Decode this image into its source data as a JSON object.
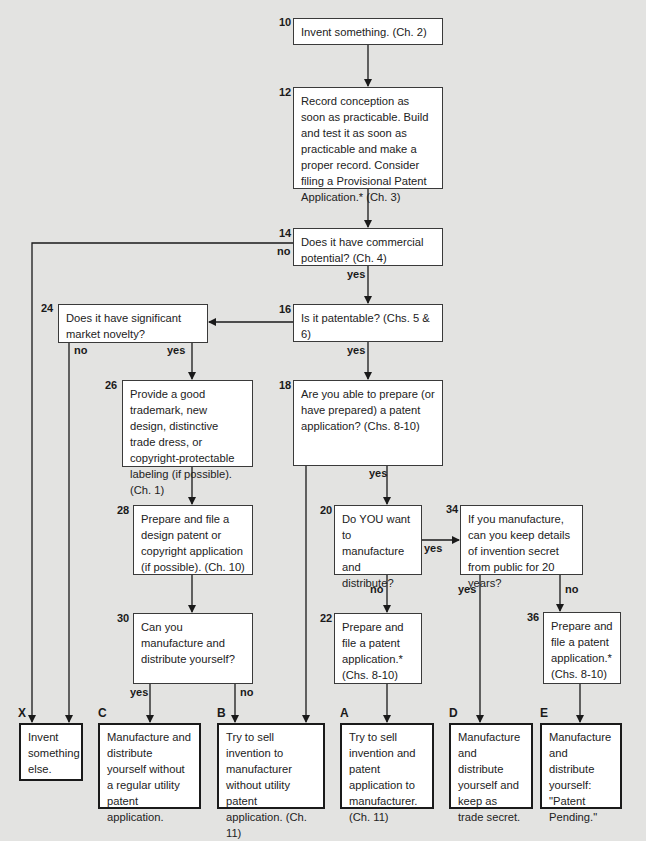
{
  "diagram": {
    "type": "flowchart",
    "nodes": [
      {
        "id": "10",
        "number": "10",
        "text": "Invent something. (Ch. 2)"
      },
      {
        "id": "12",
        "number": "12",
        "text": "Record conception as soon as practicable. Build and test it as soon as practicable and make a proper record. Consider filing a Provisional Patent Application.* (Ch. 3)"
      },
      {
        "id": "14",
        "number": "14",
        "text": "Does it have commercial potential? (Ch. 4)"
      },
      {
        "id": "16",
        "number": "16",
        "text": "Is it patentable? (Chs. 5 & 6)"
      },
      {
        "id": "18",
        "number": "18",
        "text": "Are you able to prepare (or have prepared) a patent application? (Chs. 8-10)"
      },
      {
        "id": "20",
        "number": "20",
        "text": "Do YOU want to manufacture and distribute?"
      },
      {
        "id": "22",
        "number": "22",
        "text": "Prepare and file a patent application.* (Chs. 8-10)"
      },
      {
        "id": "24",
        "number": "24",
        "text": "Does it have significant market novelty?"
      },
      {
        "id": "26",
        "number": "26",
        "text": "Provide a good trademark, new design, distinctive trade dress, or copyright-protectable labeling (if possible). (Ch. 1)"
      },
      {
        "id": "28",
        "number": "28",
        "text": "Prepare and file a design patent or copyright application (if possible). (Ch. 10)"
      },
      {
        "id": "30",
        "number": "30",
        "text": "Can you manufacture and distribute yourself?"
      },
      {
        "id": "34",
        "number": "34",
        "text": "If you manufacture, can you keep details of invention secret from public for 20 years?"
      },
      {
        "id": "36",
        "number": "36",
        "text": "Prepare and file a patent application.* (Chs. 8-10)"
      }
    ],
    "outcomes": [
      {
        "id": "X",
        "label": "X",
        "text": "Invent something else."
      },
      {
        "id": "C",
        "label": "C",
        "text": "Manufacture and distribute yourself without a regular utility patent application."
      },
      {
        "id": "B",
        "label": "B",
        "text": "Try to sell invention to manufacturer without utility patent application. (Ch. 11)"
      },
      {
        "id": "A",
        "label": "A",
        "text": "Try to sell invention and patent application to manufacturer. (Ch. 11)"
      },
      {
        "id": "D",
        "label": "D",
        "text": "Manufacture and distribute yourself and keep as trade secret."
      },
      {
        "id": "E",
        "label": "E",
        "text": "Manufacture and distribute yourself: \"Patent Pending.\""
      }
    ],
    "edge_labels": {
      "n14_no": "no",
      "n14_yes": "yes",
      "n16_yes": "yes",
      "n24_no": "no",
      "n24_yes": "yes",
      "n18_yes": "yes",
      "n20_yes": "yes",
      "n20_no": "no",
      "n34_yes": "yes",
      "n34_no": "no",
      "n30_yes": "yes",
      "n30_no": "no"
    },
    "edges": [
      {
        "from": "10",
        "to": "12"
      },
      {
        "from": "12",
        "to": "14"
      },
      {
        "from": "14",
        "to": "16",
        "label": "yes"
      },
      {
        "from": "14",
        "to": "X",
        "label": "no"
      },
      {
        "from": "16",
        "to": "24"
      },
      {
        "from": "16",
        "to": "18",
        "label": "yes"
      },
      {
        "from": "24",
        "to": "X",
        "label": "no"
      },
      {
        "from": "24",
        "to": "26",
        "label": "yes"
      },
      {
        "from": "26",
        "to": "28"
      },
      {
        "from": "28",
        "to": "30"
      },
      {
        "from": "30",
        "to": "C",
        "label": "yes"
      },
      {
        "from": "30",
        "to": "B",
        "label": "no"
      },
      {
        "from": "18",
        "to": "B"
      },
      {
        "from": "18",
        "to": "20",
        "label": "yes"
      },
      {
        "from": "20",
        "to": "34",
        "label": "yes"
      },
      {
        "from": "20",
        "to": "22",
        "label": "no"
      },
      {
        "from": "22",
        "to": "A"
      },
      {
        "from": "34",
        "to": "D",
        "label": "yes"
      },
      {
        "from": "34",
        "to": "36",
        "label": "no"
      },
      {
        "from": "36",
        "to": "E"
      }
    ]
  }
}
